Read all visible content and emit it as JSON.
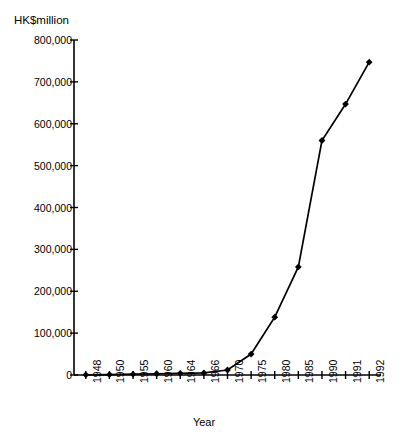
{
  "chart_data": {
    "type": "line",
    "title": "",
    "xlabel": "Year",
    "ylabel": "HK$million",
    "categories": [
      "1948",
      "1950",
      "1955",
      "1960",
      "1964",
      "1966",
      "1970",
      "1975",
      "1980",
      "1985",
      "1990",
      "1991",
      "1992"
    ],
    "values": [
      500,
      1000,
      2000,
      3000,
      4000,
      5000,
      12000,
      50000,
      138000,
      258000,
      560000,
      647000,
      747000
    ],
    "series": [
      {
        "name": "HK$million",
        "values": [
          500,
          1000,
          2000,
          3000,
          4000,
          5000,
          12000,
          50000,
          138000,
          258000,
          560000,
          647000,
          747000
        ]
      }
    ],
    "ylim": [
      0,
      800000
    ],
    "y_ticks": [
      0,
      100000,
      200000,
      300000,
      400000,
      500000,
      600000,
      700000,
      800000
    ],
    "y_tick_labels": [
      "0",
      "100,000",
      "200,000",
      "300,000",
      "400,000",
      "500,000",
      "600,000",
      "700,000",
      "800,000"
    ],
    "grid": false,
    "legend": "none",
    "marker": "diamond",
    "line_color": "#000000",
    "marker_color": "#000000",
    "axis_color": "#000000",
    "background_color": "#ffffff"
  }
}
